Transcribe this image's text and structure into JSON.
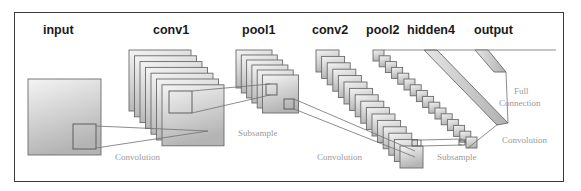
{
  "diagram": {
    "layers": [
      {
        "id": "input",
        "label": "input",
        "x": 43,
        "y": 34
      },
      {
        "id": "conv1",
        "label": "conv1",
        "x": 153,
        "y": 34
      },
      {
        "id": "pool1",
        "label": "pool1",
        "x": 242,
        "y": 34
      },
      {
        "id": "conv2",
        "label": "conv2",
        "x": 312,
        "y": 34
      },
      {
        "id": "pool2",
        "label": "pool2",
        "x": 366,
        "y": 34
      },
      {
        "id": "hidden4",
        "label": "hidden4",
        "x": 407,
        "y": 34
      },
      {
        "id": "output",
        "label": "output",
        "x": 474,
        "y": 34
      }
    ],
    "operations": [
      {
        "id": "convolution-1",
        "label": "Convolution",
        "x": 115,
        "y": 160
      },
      {
        "id": "subsample-1",
        "label": "Subsample",
        "x": 238,
        "y": 136
      },
      {
        "id": "convolution-2",
        "label": "Convolution",
        "x": 317,
        "y": 160
      },
      {
        "id": "subsample-2",
        "label": "Subsample",
        "x": 437,
        "y": 160
      },
      {
        "id": "full-connection-line1",
        "label": "Full",
        "x": 514,
        "y": 94
      },
      {
        "id": "full-connection-line2",
        "label": "Connection",
        "x": 499,
        "y": 106
      },
      {
        "id": "convolution-3",
        "label": "Convolution",
        "x": 502,
        "y": 143
      }
    ],
    "colors": {
      "frame": "#3a3a3a",
      "map_fill_top": "#f2f2f2",
      "map_fill_bottom": "#b8b8b8",
      "edge": "#6a6a6a",
      "title_text": "#1a1a1a",
      "op_text": "#9a9a9a"
    }
  }
}
